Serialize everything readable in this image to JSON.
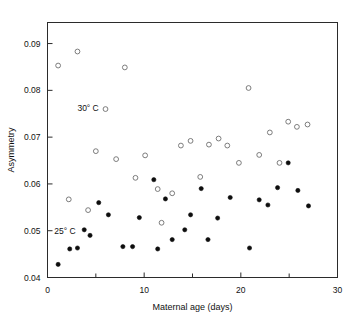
{
  "chart_data": {
    "type": "scatter",
    "title": "",
    "xlabel": "Maternal age (days)",
    "ylabel": "Asymmetry",
    "xlim": [
      0,
      30
    ],
    "ylim": [
      0.04,
      0.0945
    ],
    "xticks": [
      0,
      10,
      20,
      30
    ],
    "xtick_labels": [
      "0",
      "10",
      "20",
      "30"
    ],
    "xminorticks": [
      5,
      15,
      25
    ],
    "yticks": [
      0.04,
      0.05,
      0.06,
      0.07,
      0.08,
      0.09
    ],
    "ytick_labels": [
      "0.04",
      "0.05",
      "0.06",
      "0.07",
      "0.08",
      "0.09"
    ],
    "grid": false,
    "legend_position": "inside-annotations",
    "series": [
      {
        "name": "30° C",
        "marker": "open-circle",
        "color": "#6e6e6e",
        "annotation_label": "30° C",
        "points": [
          [
            1.1,
            0.0853
          ],
          [
            2.2,
            0.0567
          ],
          [
            3.1,
            0.0883
          ],
          [
            4.2,
            0.0544
          ],
          [
            5.0,
            0.067
          ],
          [
            6.0,
            0.076
          ],
          [
            7.1,
            0.0653
          ],
          [
            8.0,
            0.0849
          ],
          [
            9.1,
            0.0613
          ],
          [
            10.1,
            0.0661
          ],
          [
            11.4,
            0.0589
          ],
          [
            11.8,
            0.0517
          ],
          [
            12.9,
            0.058
          ],
          [
            13.8,
            0.0682
          ],
          [
            14.8,
            0.0692
          ],
          [
            15.8,
            0.0615
          ],
          [
            16.7,
            0.0684
          ],
          [
            17.7,
            0.0697
          ],
          [
            18.6,
            0.0682
          ],
          [
            19.8,
            0.0645
          ],
          [
            20.8,
            0.0805
          ],
          [
            21.9,
            0.0662
          ],
          [
            23.0,
            0.071
          ],
          [
            24.0,
            0.0645
          ],
          [
            24.9,
            0.0733
          ],
          [
            25.8,
            0.0722
          ],
          [
            26.9,
            0.0727
          ]
        ]
      },
      {
        "name": "25° C",
        "marker": "filled-circle",
        "color": "#0d0d0d",
        "annotation_label": "25° C",
        "points": [
          [
            1.1,
            0.0428
          ],
          [
            2.3,
            0.0461
          ],
          [
            3.1,
            0.0463
          ],
          [
            3.8,
            0.0502
          ],
          [
            4.4,
            0.049
          ],
          [
            5.3,
            0.056
          ],
          [
            6.3,
            0.0534
          ],
          [
            7.8,
            0.0466
          ],
          [
            8.8,
            0.0466
          ],
          [
            9.5,
            0.0528
          ],
          [
            11.0,
            0.0609
          ],
          [
            11.4,
            0.0461
          ],
          [
            12.2,
            0.0568
          ],
          [
            12.9,
            0.0481
          ],
          [
            14.2,
            0.0502
          ],
          [
            14.8,
            0.0534
          ],
          [
            15.9,
            0.059
          ],
          [
            16.6,
            0.0481
          ],
          [
            17.6,
            0.0527
          ],
          [
            18.9,
            0.0571
          ],
          [
            20.9,
            0.0463
          ],
          [
            21.9,
            0.0566
          ],
          [
            22.8,
            0.0555
          ],
          [
            23.8,
            0.0592
          ],
          [
            24.9,
            0.0645
          ],
          [
            25.9,
            0.0586
          ],
          [
            27.0,
            0.0553
          ]
        ]
      }
    ],
    "annotations": [
      {
        "text": "30° C",
        "x": 4.2,
        "y": 0.0762
      },
      {
        "text": "25° C",
        "x": 1.8,
        "y": 0.05
      }
    ]
  }
}
